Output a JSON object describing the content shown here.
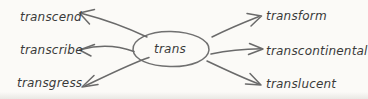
{
  "diagram": {
    "type": "word-web",
    "center_node": {
      "label": "trans"
    },
    "left_items": [
      {
        "label": "transcend"
      },
      {
        "label": "transcribe"
      },
      {
        "label": "transgress"
      }
    ],
    "right_items": [
      {
        "label": "transform"
      },
      {
        "label": "transcontinental"
      },
      {
        "label": "translucent"
      }
    ],
    "colors": {
      "background": "#fbfaf7",
      "stroke": "#6a6a6a",
      "text": "#3a3a3a"
    }
  }
}
